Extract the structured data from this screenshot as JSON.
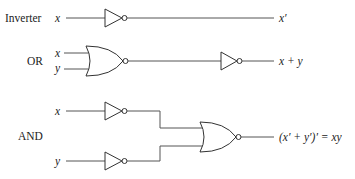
{
  "diagram": {
    "rows": [
      {
        "label": "Inverter",
        "inputs": [
          "x"
        ],
        "output": "x′",
        "gates": [
          "NOR-as-inverter"
        ]
      },
      {
        "label": "OR",
        "inputs": [
          "x",
          "y"
        ],
        "output": "x + y",
        "gates": [
          "NOR",
          "NOR-as-inverter"
        ]
      },
      {
        "label": "AND",
        "inputs": [
          "x",
          "y"
        ],
        "output": "(x′ + y′)′ = xy",
        "gates": [
          "NOR-as-inverter",
          "NOR-as-inverter",
          "NOR"
        ]
      }
    ],
    "colors": {
      "wire": "#555555",
      "gate_stroke": "#333333",
      "text": "#222222",
      "background": "#ffffff"
    }
  }
}
